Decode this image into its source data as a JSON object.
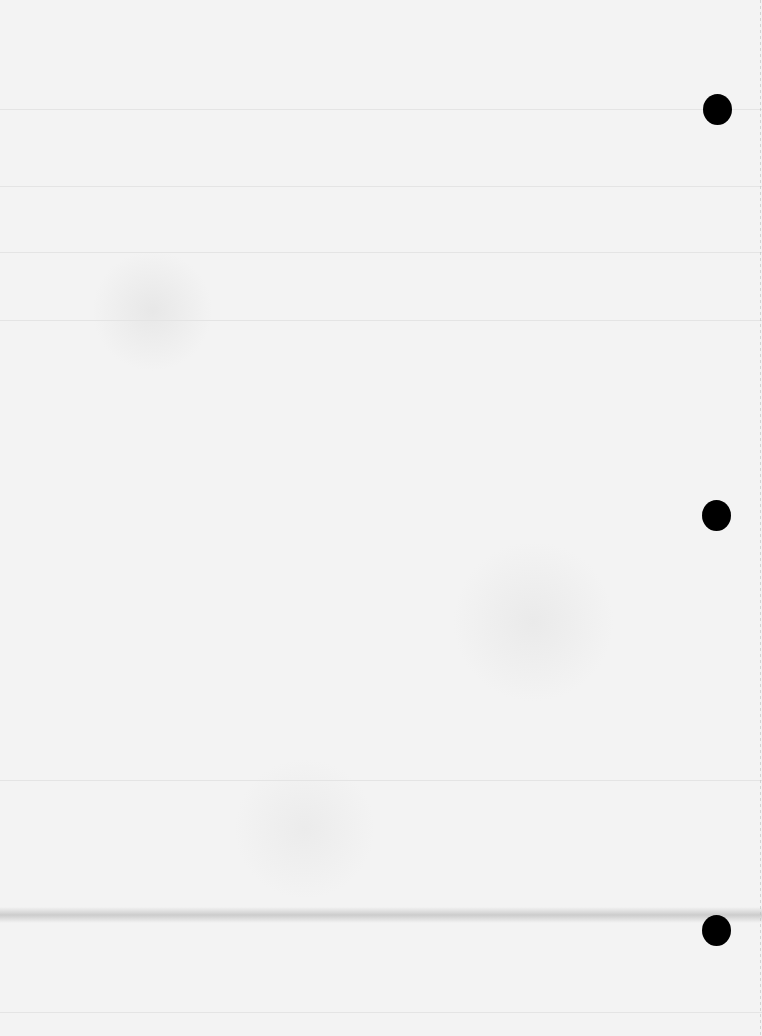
{
  "document": {
    "type": "blank scanned paper page",
    "text": "",
    "background_color": "#f3f3f3",
    "hole_color": "#000000",
    "holes": [
      {
        "x": 717,
        "y": 109
      },
      {
        "x": 716,
        "y": 516
      },
      {
        "x": 716,
        "y": 931
      }
    ],
    "fold_lines_y": [
      109,
      186,
      252,
      320,
      780,
      915,
      1012
    ]
  }
}
